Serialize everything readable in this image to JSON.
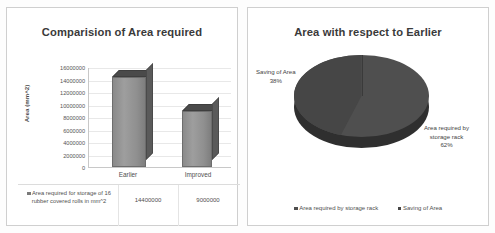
{
  "left_panel": {
    "title": "Comparision of Area required",
    "ylabel": "Area  (mm^2)",
    "yticks": [
      "16000000",
      "14000000",
      "12000000",
      "10000000",
      "8000000",
      "6000000",
      "4000000",
      "2000000",
      "0"
    ],
    "categories": [
      "Earlier",
      "Improved"
    ],
    "table": {
      "series_label": "Area required for storage of 16 rubber covered rolls in mm^2",
      "values": [
        "14400000",
        "9000000"
      ]
    }
  },
  "right_panel": {
    "title": "Area with respect to Earlier",
    "labels": {
      "saving_name": "Saving of Area",
      "saving_pct": "38%",
      "rack_name_line1": "Area required by",
      "rack_name_line2": "storage rack",
      "rack_pct": "62%"
    },
    "legend": [
      {
        "label": "Area required by storage rack",
        "color": "#4f4f4f"
      },
      {
        "label": "Saving of Area",
        "color": "#464646"
      }
    ]
  },
  "chart_data": [
    {
      "type": "bar",
      "title": "Comparision of Area required",
      "xlabel": "",
      "ylabel": "Area  (mm^2)",
      "categories": [
        "Earlier",
        "Improved"
      ],
      "series": [
        {
          "name": "Area required for storage of 16 rubber covered rolls in mm^2",
          "values": [
            14400000,
            9000000
          ]
        }
      ],
      "ylim": [
        0,
        16000000
      ],
      "ytick_step": 2000000,
      "ytick_labels": [
        "0",
        "2000000",
        "4000000",
        "6000000",
        "8000000",
        "10000000",
        "12000000",
        "14000000",
        "16000000"
      ],
      "grid": true,
      "legend_position": "bottom-table",
      "three_d": true,
      "data_labels_shown_in_table": true
    },
    {
      "type": "pie",
      "title": "Area with respect to Earlier",
      "labels": [
        "Area required by storage rack",
        "Saving of Area"
      ],
      "values": [
        62,
        38
      ],
      "value_unit": "percent",
      "annotations": [
        "Saving of Area 38%",
        "Area required by storage rack 62%"
      ],
      "legend_position": "bottom",
      "three_d": true,
      "grid": false
    }
  ]
}
